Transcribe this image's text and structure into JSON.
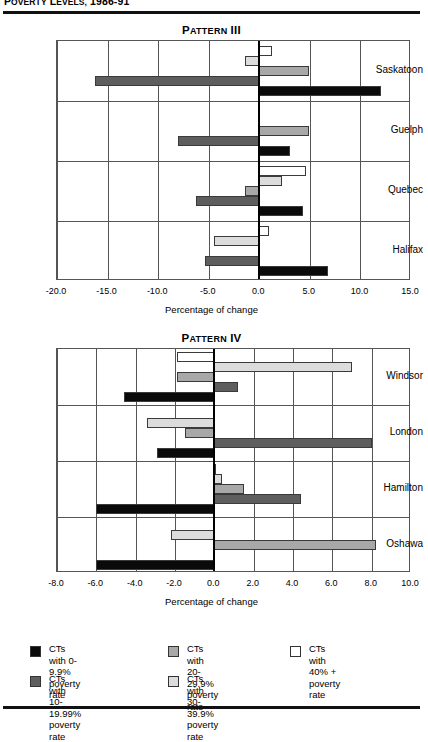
{
  "header": {
    "title": "POVERTY LEVELS, 1986-91"
  },
  "legend": {
    "items": [
      {
        "label": "CTs with 0-9.9%\npoverty rate",
        "color": "#0a0a0a",
        "swatch_name": "legend-swatch-0-9"
      },
      {
        "label": "CTs with 10-19.99%\npoverty rate",
        "color": "#5e5e5e",
        "swatch_name": "legend-swatch-10-19"
      },
      {
        "label": "CTs with 20-29.9%\npoverty rate",
        "color": "#a8a8a8",
        "swatch_name": "legend-swatch-20-29"
      },
      {
        "label": "CTs with 30-39.9%\npoverty rate",
        "color": "#dcdcdc",
        "swatch_name": "legend-swatch-30-39"
      },
      {
        "label": "CTs with 40% +\npoverty rate",
        "color": "#ffffff",
        "swatch_name": "legend-swatch-40-plus"
      }
    ]
  },
  "chart_data": [
    {
      "type": "bar",
      "orientation": "horizontal",
      "title": "PATTERN III",
      "xlabel": "Percentage of change",
      "ylabel": "",
      "xlim": [
        -20.0,
        15.0
      ],
      "xticks": [
        -20.0,
        -15.0,
        -10.0,
        -5.0,
        0.0,
        5.0,
        10.0,
        15.0
      ],
      "xticklabels": [
        "-20.0",
        "-15.0",
        "-10.0",
        "-5.0",
        "0.0",
        "5.0",
        "10.0",
        "15.0"
      ],
      "grid": true,
      "legend_position": "bottom",
      "categories": [
        "Saskatoon",
        "Guelph",
        "Quebec",
        "Halifax"
      ],
      "series": [
        {
          "name": "CTs with 40% +",
          "color": "#ffffff",
          "values": [
            1.3,
            0.0,
            4.6,
            1.0
          ]
        },
        {
          "name": "CTs with 30-39.9%",
          "color": "#dcdcdc",
          "values": [
            -1.4,
            0.0,
            2.2,
            -4.5
          ]
        },
        {
          "name": "CTs with 20-29.9%",
          "color": "#a8a8a8",
          "values": [
            4.9,
            4.9,
            -1.4,
            0.0
          ]
        },
        {
          "name": "CTs with 10-19.99%",
          "color": "#5e5e5e",
          "values": [
            -16.2,
            -8.0,
            -6.3,
            -5.4
          ]
        },
        {
          "name": "CTs with 0-9.9%",
          "color": "#0a0a0a",
          "values": [
            12.0,
            3.0,
            4.3,
            6.8
          ]
        }
      ]
    },
    {
      "type": "bar",
      "orientation": "horizontal",
      "title": "PATTERN IV",
      "xlabel": "Percentage of change",
      "ylabel": "",
      "xlim": [
        -8.0,
        10.0
      ],
      "xticks": [
        -8.0,
        -6.0,
        -4.0,
        -2.0,
        0.0,
        2.0,
        4.0,
        6.0,
        8.0,
        10.0
      ],
      "xticklabels": [
        "-8.0",
        "-6.0",
        "-4.0",
        "-2.0",
        "0.0",
        "2.0",
        "4.0",
        "6.0",
        "8.0",
        "10.0"
      ],
      "grid": true,
      "legend_position": "bottom",
      "categories": [
        "Windsor",
        "London",
        "Hamilton",
        "Oshawa"
      ],
      "series": [
        {
          "name": "CTs with 40% +",
          "color": "#ffffff",
          "values": [
            -1.9,
            0.0,
            0.1,
            0.0
          ]
        },
        {
          "name": "CTs with 30-39.9%",
          "color": "#dcdcdc",
          "values": [
            7.0,
            -3.4,
            0.4,
            -2.2
          ]
        },
        {
          "name": "CTs with 20-29.9%",
          "color": "#a8a8a8",
          "values": [
            -1.9,
            -1.5,
            1.5,
            8.2
          ]
        },
        {
          "name": "CTs with 10-19.99%",
          "color": "#5e5e5e",
          "values": [
            1.2,
            8.0,
            4.4,
            0.0
          ]
        },
        {
          "name": "CTs with 0-9.9%",
          "color": "#0a0a0a",
          "values": [
            -4.6,
            -2.9,
            -6.0,
            -6.0
          ]
        }
      ]
    }
  ]
}
